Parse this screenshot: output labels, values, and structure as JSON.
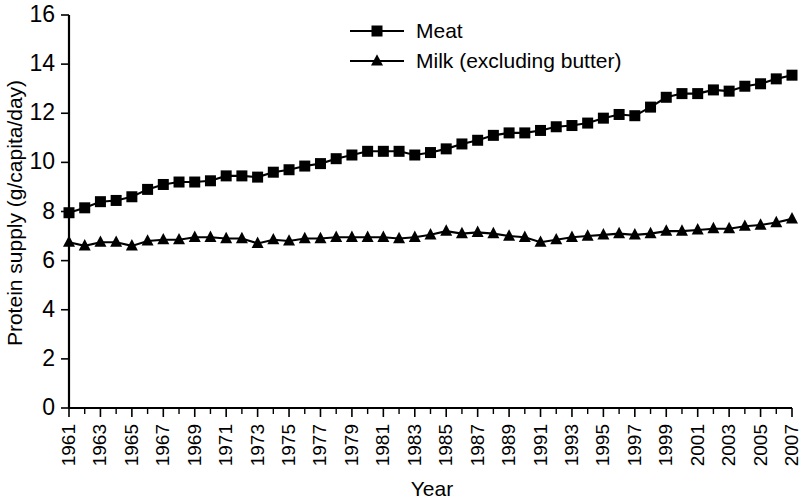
{
  "chart_data": {
    "type": "line",
    "title": "",
    "xlabel": "Year",
    "ylabel": "Protein supply (g/capita/day)",
    "xlim": [
      1961,
      2007
    ],
    "ylim": [
      0,
      16
    ],
    "ytick_step": 2,
    "grid": false,
    "legend_position": "top-center",
    "xtick_labels": [
      "1961",
      "1963",
      "1965",
      "1967",
      "1969",
      "1971",
      "1973",
      "1975",
      "1977",
      "1979",
      "1981",
      "1983",
      "1985",
      "1987",
      "1989",
      "1991",
      "1993",
      "1995",
      "1997",
      "1999",
      "2001",
      "2003",
      "2005",
      "2007"
    ],
    "ytick_labels": [
      "0",
      "2",
      "4",
      "6",
      "8",
      "10",
      "12",
      "14",
      "16"
    ],
    "x": [
      1961,
      1962,
      1963,
      1964,
      1965,
      1966,
      1967,
      1968,
      1969,
      1970,
      1971,
      1972,
      1973,
      1974,
      1975,
      1976,
      1977,
      1978,
      1979,
      1980,
      1981,
      1982,
      1983,
      1984,
      1985,
      1986,
      1987,
      1988,
      1989,
      1990,
      1991,
      1992,
      1993,
      1994,
      1995,
      1996,
      1997,
      1998,
      1999,
      2000,
      2001,
      2002,
      2003,
      2004,
      2005,
      2006,
      2007
    ],
    "series": [
      {
        "name": "Meat",
        "marker": "square",
        "values": [
          7.95,
          8.15,
          8.4,
          8.45,
          8.6,
          8.9,
          9.1,
          9.2,
          9.2,
          9.25,
          9.45,
          9.45,
          9.4,
          9.6,
          9.7,
          9.85,
          9.95,
          10.15,
          10.3,
          10.45,
          10.45,
          10.45,
          10.3,
          10.4,
          10.55,
          10.75,
          10.9,
          11.1,
          11.2,
          11.2,
          11.3,
          11.45,
          11.5,
          11.6,
          11.8,
          11.95,
          11.9,
          12.25,
          12.65,
          12.8,
          12.8,
          12.95,
          12.9,
          13.1,
          13.2,
          13.4,
          13.55
        ]
      },
      {
        "name": "Milk (excluding butter)",
        "marker": "triangle",
        "values": [
          6.75,
          6.6,
          6.75,
          6.75,
          6.6,
          6.8,
          6.85,
          6.85,
          6.95,
          6.95,
          6.9,
          6.9,
          6.7,
          6.85,
          6.8,
          6.9,
          6.9,
          6.95,
          6.95,
          6.95,
          6.95,
          6.9,
          6.95,
          7.05,
          7.2,
          7.1,
          7.15,
          7.1,
          7.0,
          6.95,
          6.75,
          6.85,
          6.95,
          7.0,
          7.05,
          7.1,
          7.05,
          7.1,
          7.2,
          7.2,
          7.25,
          7.3,
          7.3,
          7.4,
          7.45,
          7.55,
          7.7
        ]
      }
    ]
  },
  "legend": {
    "items": [
      {
        "label": "Meat"
      },
      {
        "label": "Milk (excluding butter)"
      }
    ]
  }
}
